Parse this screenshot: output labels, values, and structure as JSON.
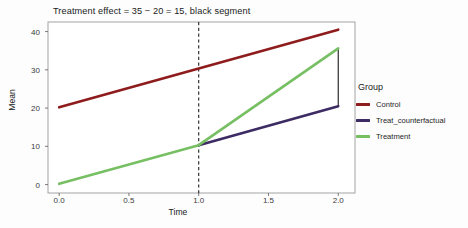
{
  "chart_data": {
    "type": "line",
    "title": "Treatment effect = 35 − 20 = 15, black segment",
    "xlabel": "Time",
    "ylabel": "Mean",
    "xlim": [
      -0.08,
      2.12
    ],
    "ylim": [
      -2.2,
      42.5
    ],
    "xticks": [
      "0.0",
      "0.5",
      "1.0",
      "1.5",
      "2.0"
    ],
    "xtick_values": [
      0.0,
      0.5,
      1.0,
      1.5,
      2.0
    ],
    "yticks": [
      "0",
      "10",
      "20",
      "30",
      "40"
    ],
    "ytick_values": [
      0,
      10,
      20,
      30,
      40
    ],
    "grid": false,
    "legend_position": "right",
    "legend_title": "Group",
    "x": [
      0.0,
      1.0,
      2.0
    ],
    "series": [
      {
        "name": "Control",
        "color": "#8E1C1C",
        "x": [
          0.0,
          2.0
        ],
        "values": [
          20.2,
          40.5
        ]
      },
      {
        "name": "Treat_counterfactual",
        "color": "#3D2B63",
        "x": [
          1.0,
          2.0
        ],
        "values": [
          10.3,
          20.5
        ]
      },
      {
        "name": "Treatment",
        "color": "#77BF63",
        "x": [
          0.0,
          1.0,
          2.0
        ],
        "values": [
          0.2,
          10.3,
          35.6
        ]
      }
    ],
    "annotations": [
      {
        "name": "intervention-line",
        "type": "vline",
        "x": 1.0,
        "style": "dashed",
        "color": "#222222"
      },
      {
        "name": "treatment-effect-segment",
        "type": "vsegment",
        "x": 2.0,
        "y0": 20.5,
        "y1": 35.6,
        "style": "solid",
        "color": "#2b2b2b",
        "label": "black segment"
      }
    ]
  },
  "legend": {
    "title": "Group",
    "items": [
      {
        "label": "Control",
        "color": "#8E1C1C"
      },
      {
        "label": "Treat_counterfactual",
        "color": "#3D2B63"
      },
      {
        "label": "Treatment",
        "color": "#77BF63"
      }
    ]
  },
  "axes": {
    "x_title": "Time",
    "y_title": "Mean",
    "x_ticks": [
      "0.0",
      "0.5",
      "1.0",
      "1.5",
      "2.0"
    ],
    "y_ticks": [
      "0",
      "10",
      "20",
      "30",
      "40"
    ]
  },
  "title": "Treatment effect = 35 − 20 = 15, black segment"
}
